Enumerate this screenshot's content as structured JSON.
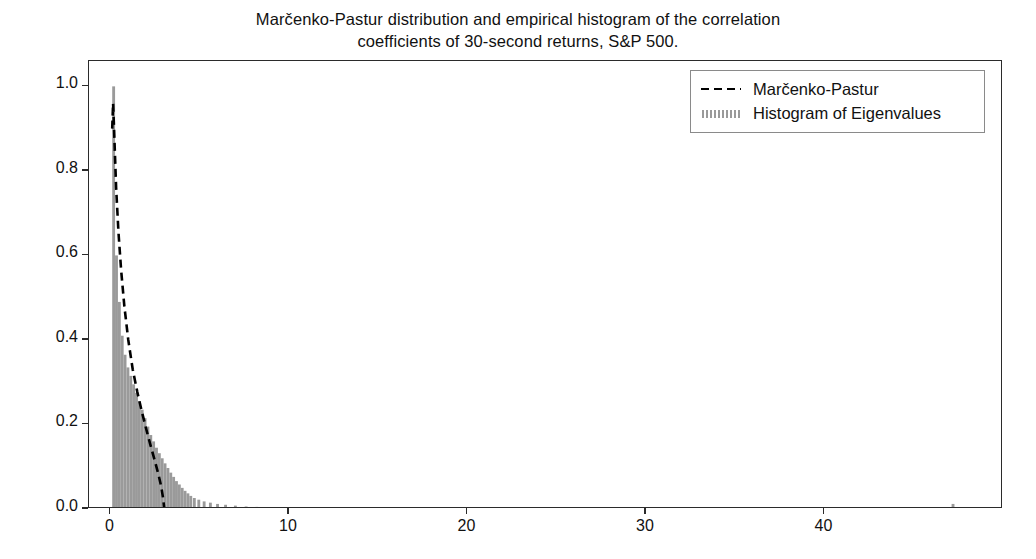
{
  "chart_data": {
    "type": "bar",
    "title_line1": "Marčenko-Pastur distribution and empirical histogram of the correlation",
    "title_line2": "coefficients of 30-second returns, S&P 500.",
    "xlabel": "",
    "ylabel": "",
    "xlim": [
      -1.2,
      50.0
    ],
    "ylim": [
      0.0,
      1.06
    ],
    "xticks": [
      0,
      10,
      20,
      30,
      40
    ],
    "xticklabels": [
      "0",
      "10",
      "20",
      "30",
      "40"
    ],
    "yticks": [
      0.0,
      0.2,
      0.4,
      0.6,
      0.8,
      1.0
    ],
    "yticklabels": [
      "0.0",
      "0.2",
      "0.4",
      "0.6",
      "0.8",
      "1.0"
    ],
    "grid": false,
    "legend_position": "upper right",
    "series": [
      {
        "name": "Histogram of Eigenvalues",
        "type": "bar",
        "color": "#9a9a9a",
        "bar_width": 0.16,
        "x": [
          0.18,
          0.34,
          0.5,
          0.66,
          0.82,
          0.98,
          1.14,
          1.3,
          1.46,
          1.62,
          1.78,
          1.94,
          2.1,
          2.26,
          2.42,
          2.58,
          2.74,
          2.9,
          3.06,
          3.22,
          3.38,
          3.54,
          3.7,
          3.86,
          4.02,
          4.18,
          4.34,
          4.5,
          4.7,
          4.95,
          5.25,
          5.6,
          6.0,
          6.45,
          7.0,
          7.6,
          8.2,
          47.2
        ],
        "values": [
          1.0,
          0.6,
          0.49,
          0.41,
          0.365,
          0.335,
          0.315,
          0.295,
          0.275,
          0.255,
          0.235,
          0.215,
          0.195,
          0.175,
          0.16,
          0.145,
          0.132,
          0.12,
          0.108,
          0.097,
          0.086,
          0.076,
          0.066,
          0.058,
          0.05,
          0.043,
          0.037,
          0.031,
          0.026,
          0.022,
          0.018,
          0.015,
          0.012,
          0.01,
          0.008,
          0.006,
          0.005,
          0.012
        ]
      },
      {
        "name": "Marčenko-Pastur",
        "type": "line",
        "linestyle": "dashed",
        "color": "#000000",
        "x": [
          0.1,
          0.15,
          0.22,
          0.32,
          0.45,
          0.6,
          0.78,
          1.0,
          1.25,
          1.5,
          1.75,
          2.0,
          2.25,
          2.5,
          2.7,
          2.85,
          2.95,
          3.02
        ],
        "values": [
          0.9,
          0.96,
          0.88,
          0.76,
          0.655,
          0.565,
          0.48,
          0.4,
          0.33,
          0.278,
          0.232,
          0.19,
          0.15,
          0.112,
          0.08,
          0.052,
          0.026,
          0.0
        ]
      }
    ]
  },
  "legend": {
    "entries": [
      {
        "label": "Marčenko-Pastur",
        "sample": "dashed-line"
      },
      {
        "label": "Histogram of Eigenvalues",
        "sample": "gray-patch"
      }
    ]
  },
  "colors": {
    "bar": "#9a9a9a",
    "curve": "#000000",
    "axis": "#2b2b2b",
    "background": "#ffffff"
  }
}
